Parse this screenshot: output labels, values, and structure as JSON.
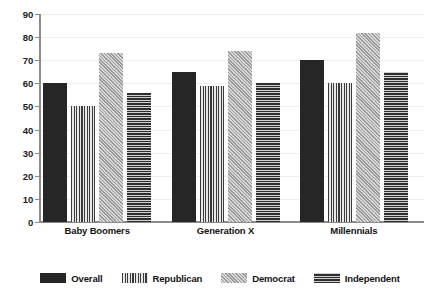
{
  "chart_data": {
    "type": "bar",
    "title": "",
    "subtitle": "",
    "xlabel": "",
    "ylabel": "",
    "ylim": [
      0,
      90
    ],
    "ytick_step": 10,
    "yticks": [
      0,
      10,
      20,
      30,
      40,
      50,
      60,
      70,
      80,
      90
    ],
    "ytick_labels": [
      "0",
      "10",
      "20",
      "30",
      "40",
      "50",
      "60",
      "70",
      "80",
      "90"
    ],
    "grid": true,
    "grid_axis": "y",
    "legend_position": "bottom",
    "categories": [
      "Baby Boomers",
      "Generation X",
      "Millennials"
    ],
    "series": [
      {
        "name": "Overall",
        "pattern": "solid",
        "color": "#262626",
        "values": [
          60,
          65,
          70
        ]
      },
      {
        "name": "Republican",
        "pattern": "vertical-lines",
        "color": "#3b3b3b",
        "values": [
          50,
          59,
          60
        ]
      },
      {
        "name": "Democrat",
        "pattern": "diagonal-crosshatch",
        "color": "#c9c9c9",
        "values": [
          73,
          74,
          82
        ]
      },
      {
        "name": "Independent",
        "pattern": "horizontal-lines",
        "color": "#2e2e2e",
        "values": [
          56,
          60,
          65
        ]
      }
    ]
  },
  "axis": {
    "line_color": "#8c8c8c",
    "grid_color": "#eeeeee",
    "label_color": "#141414"
  }
}
